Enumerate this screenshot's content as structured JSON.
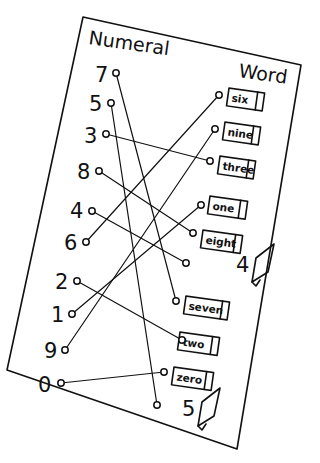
{
  "headers": {
    "left": "Numeral",
    "right": "Word"
  },
  "numerals": [
    {
      "id": "n7",
      "label": "7",
      "x": 95,
      "y": 82,
      "dot": [
        116,
        73
      ]
    },
    {
      "id": "n5",
      "label": "5",
      "x": 89,
      "y": 111,
      "dot": [
        111,
        103
      ]
    },
    {
      "id": "n3",
      "label": "3",
      "x": 84,
      "y": 143,
      "dot": [
        106,
        134
      ]
    },
    {
      "id": "n8",
      "label": "8",
      "x": 77,
      "y": 179,
      "dot": [
        99,
        171
      ]
    },
    {
      "id": "n4",
      "label": "4",
      "x": 70,
      "y": 218,
      "dot": [
        92,
        211
      ]
    },
    {
      "id": "n6",
      "label": "6",
      "x": 64,
      "y": 250,
      "dot": [
        86,
        242
      ]
    },
    {
      "id": "n2",
      "label": "2",
      "x": 55,
      "y": 289,
      "dot": [
        77,
        281
      ]
    },
    {
      "id": "n1",
      "label": "1",
      "x": 51,
      "y": 322,
      "dot": [
        72,
        314
      ]
    },
    {
      "id": "n9",
      "label": "9",
      "x": 44,
      "y": 358,
      "dot": [
        65,
        350
      ]
    },
    {
      "id": "n0",
      "label": "0",
      "x": 38,
      "y": 392,
      "dot": [
        61,
        383
      ]
    }
  ],
  "words": [
    {
      "id": "w6",
      "label": "six",
      "box": [
        229,
        88,
        36,
        18
      ],
      "dot": [
        219,
        95
      ]
    },
    {
      "id": "w9",
      "label": "nine",
      "box": [
        225,
        122,
        36,
        18
      ],
      "dot": [
        215,
        129
      ]
    },
    {
      "id": "w3",
      "label": "three",
      "box": [
        220,
        156,
        36,
        18
      ],
      "dot": [
        210,
        161
      ]
    },
    {
      "id": "w1",
      "label": "one",
      "box": [
        210,
        196,
        38,
        18
      ],
      "dot": [
        201,
        205
      ]
    },
    {
      "id": "w8",
      "label": "eight",
      "box": [
        203,
        230,
        40,
        18
      ],
      "dot": [
        193,
        233
      ]
    },
    {
      "id": "w7",
      "label": "seven",
      "box": [
        186,
        296,
        44,
        18
      ],
      "dot": [
        176,
        301
      ]
    },
    {
      "id": "w2",
      "label": "two",
      "box": [
        180,
        332,
        40,
        18
      ],
      "dot": [
        182,
        340
      ]
    },
    {
      "id": "w0",
      "label": "zero",
      "box": [
        174,
        367,
        40,
        18
      ],
      "dot": [
        164,
        372
      ]
    }
  ],
  "answer_slots": [
    {
      "id": "slot4",
      "label": "4",
      "x": 236,
      "y": 272,
      "dot": [
        186,
        263
      ]
    },
    {
      "id": "slot5",
      "label": "5",
      "x": 182,
      "y": 416,
      "dot": [
        157,
        405
      ]
    }
  ],
  "connections": [
    {
      "from": "n7",
      "to": "w7"
    },
    {
      "from": "n5",
      "to": "slot5"
    },
    {
      "from": "n3",
      "to": "w3"
    },
    {
      "from": "n8",
      "to": "w8"
    },
    {
      "from": "n4",
      "to": "slot4"
    },
    {
      "from": "n6",
      "to": "w6"
    },
    {
      "from": "n2",
      "to": "w2"
    },
    {
      "from": "n1",
      "to": "w1"
    },
    {
      "from": "n9",
      "to": "w9"
    },
    {
      "from": "n0",
      "to": "w0"
    }
  ],
  "colors": {
    "ink": "#111111",
    "paper": "#ffffff"
  }
}
